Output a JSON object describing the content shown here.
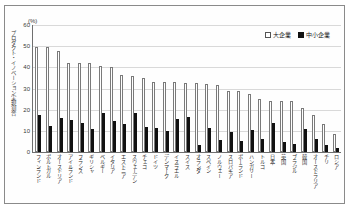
{
  "unit_label": "(%)",
  "y_axis_title": "プロダクト・イノベーション実現割合",
  "legend": {
    "large_label": "大企業",
    "sme_label": "中小企業"
  },
  "chart_data": {
    "type": "bar",
    "title": "",
    "xlabel": "",
    "ylabel": "プロダクト・イノベーション実現割合",
    "unit": "(%)",
    "ylim": [
      0,
      60
    ],
    "yticks": [
      0,
      10,
      20,
      30,
      40,
      50,
      60
    ],
    "grid": true,
    "legend_position": "top-right",
    "categories": [
      "フィンランド",
      "ポルトガル",
      "オーストリア",
      "アイルランド",
      "フランス",
      "ギリシャ",
      "ベルギー",
      "イタリア",
      "エストニア",
      "スウェーデン",
      "チェコ",
      "ドイツ",
      "デンマーク",
      "イスラエル",
      "スイス",
      "オランダ",
      "スペイン",
      "ノルウェー",
      "スロバキア",
      "ポーランド",
      "ハンガリー",
      "トルコ",
      "日本",
      "英国",
      "ブラジル",
      "韓国",
      "オーストラリア",
      "チリ",
      "ロシア"
    ],
    "series": [
      {
        "name": "大企業",
        "values": [
          49.5,
          49.5,
          47.5,
          42.0,
          42.0,
          42.0,
          40.5,
          40.0,
          36.5,
          36.0,
          35.0,
          33.0,
          33.0,
          33.0,
          32.5,
          32.5,
          32.0,
          31.5,
          29.0,
          29.0,
          27.5,
          25.0,
          24.0,
          24.0,
          24.0,
          21.0,
          17.5,
          13.0,
          8.5
        ]
      },
      {
        "name": "中小企業",
        "values": [
          17.5,
          12.5,
          16.0,
          15.0,
          13.5,
          11.0,
          18.5,
          14.5,
          13.0,
          18.5,
          12.0,
          11.5,
          10.0,
          15.5,
          16.5,
          3.5,
          11.5,
          5.5,
          9.5,
          5.0,
          10.5,
          6.0,
          13.5,
          4.5,
          4.0,
          11.0,
          6.0,
          3.5,
          2.0
        ]
      }
    ]
  }
}
